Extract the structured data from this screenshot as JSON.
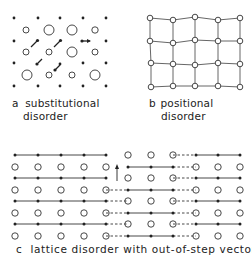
{
  "panels": {
    "a": {
      "letter": "a",
      "line1": "substitutional",
      "line2": "disorder"
    },
    "b": {
      "letter": "b",
      "line1": "positional",
      "line2": "disorder"
    },
    "c": {
      "letter": "c",
      "caption": "lattice disorder with out-of-step vector"
    }
  },
  "colors": {
    "ink": "#222222",
    "background": "#ffffff"
  }
}
